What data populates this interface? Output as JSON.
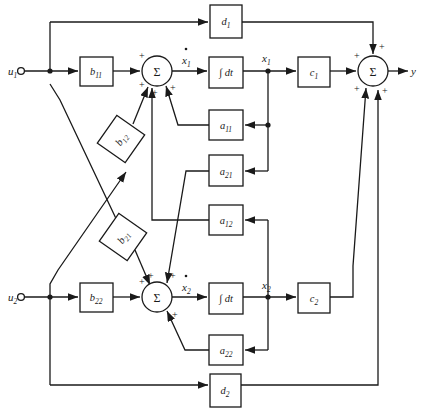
{
  "diagram": {
    "colors": {
      "line": "#1a1a1a",
      "background": "#ffffff",
      "text": "#1a1a1a"
    },
    "inputs": [
      {
        "id": "u1",
        "base": "u",
        "sub": "1"
      },
      {
        "id": "u2",
        "base": "u",
        "sub": "2"
      }
    ],
    "outputs": [
      {
        "id": "y",
        "base": "y",
        "sub": ""
      }
    ],
    "signals": [
      {
        "id": "x1dot",
        "base": "x",
        "sub": "1",
        "dot": true
      },
      {
        "id": "x1",
        "base": "x",
        "sub": "1",
        "dot": false
      },
      {
        "id": "x2dot",
        "base": "x",
        "sub": "2",
        "dot": true
      },
      {
        "id": "x2",
        "base": "x",
        "sub": "2",
        "dot": false
      }
    ],
    "blocks": [
      {
        "id": "d1",
        "base": "d",
        "sub": "1",
        "x": 210,
        "y": 5,
        "w": 32,
        "h": 33,
        "rot": 0
      },
      {
        "id": "b11",
        "base": "b",
        "sub": "11",
        "x": 80,
        "y": 57,
        "w": 33,
        "h": 29,
        "rot": 0
      },
      {
        "id": "int1",
        "base": "∫ dt",
        "sub": "",
        "x": 209,
        "y": 57,
        "w": 34,
        "h": 31,
        "rot": 0
      },
      {
        "id": "c1",
        "base": "c",
        "sub": "1",
        "x": 298,
        "y": 57,
        "w": 32,
        "h": 30,
        "rot": 0
      },
      {
        "id": "a11",
        "base": "a",
        "sub": "11",
        "x": 209,
        "y": 110,
        "w": 34,
        "h": 30,
        "rot": 0
      },
      {
        "id": "b12",
        "base": "b",
        "sub": "12",
        "x": 104,
        "y": 122,
        "w": 34,
        "h": 34,
        "rot": -55
      },
      {
        "id": "a21",
        "base": "a",
        "sub": "21",
        "x": 209,
        "y": 155,
        "w": 34,
        "h": 31,
        "rot": 0
      },
      {
        "id": "a12",
        "base": "a",
        "sub": "12",
        "x": 209,
        "y": 205,
        "w": 34,
        "h": 30,
        "rot": 0
      },
      {
        "id": "b21",
        "base": "b",
        "sub": "21",
        "x": 106,
        "y": 220,
        "w": 34,
        "h": 34,
        "rot": -55
      },
      {
        "id": "b22",
        "base": "b",
        "sub": "22",
        "x": 80,
        "y": 283,
        "w": 33,
        "h": 29,
        "rot": 0
      },
      {
        "id": "int2",
        "base": "∫ dt",
        "sub": "",
        "x": 209,
        "y": 283,
        "w": 34,
        "h": 31,
        "rot": 0
      },
      {
        "id": "c2",
        "base": "c",
        "sub": "2",
        "x": 298,
        "y": 283,
        "w": 32,
        "h": 30,
        "rot": 0
      },
      {
        "id": "a22",
        "base": "a",
        "sub": "22",
        "x": 209,
        "y": 335,
        "w": 34,
        "h": 30,
        "rot": 0
      },
      {
        "id": "d2",
        "base": "d",
        "sub": "2",
        "x": 210,
        "y": 374,
        "w": 31,
        "h": 33,
        "rot": 0
      }
    ],
    "summers": [
      {
        "id": "sum1",
        "symbol": "Σ",
        "cx": 157,
        "cy": 71,
        "r": 15,
        "signs": [
          "+",
          "+",
          "+",
          "+"
        ]
      },
      {
        "id": "sum2",
        "symbol": "Σ",
        "cx": 157,
        "cy": 297,
        "r": 15,
        "signs": [
          "+",
          "+",
          "+",
          "+"
        ]
      },
      {
        "id": "sumy",
        "symbol": "Σ",
        "cx": 373,
        "cy": 71,
        "r": 15,
        "signs": [
          "+",
          "+",
          "+",
          "+"
        ]
      }
    ],
    "sign_labels": {
      "plus": "+"
    },
    "equations_implied": {
      "state1": "x1dot = b11*u1 + b12*u2 + a11*x1 + a12*x2",
      "state2": "x2dot = b21*u1 + b22*u2 + a21*x1 + a22*x2",
      "output": "y = c1*x1 + c2*x2 + d1*u1 + d2*u2"
    }
  }
}
